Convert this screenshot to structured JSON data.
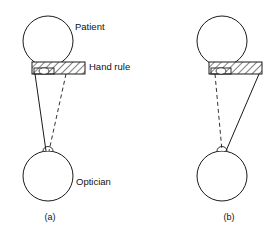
{
  "figure": {
    "width": 276,
    "height": 232,
    "background_color": "#ffffff",
    "line_color": "#1a1a1a",
    "text_color": "#111111",
    "labels": {
      "patient": "Patient",
      "hand_rule": "Hand rule",
      "optician": "Optician"
    },
    "panels": [
      {
        "caption": "(a)",
        "caption_x": 50,
        "caption_y": 218,
        "patient": {
          "cx": 48,
          "cy": 41,
          "r": 25
        },
        "optician": {
          "cx": 48,
          "cy": 176,
          "r": 25
        },
        "nose": {
          "cx": 48,
          "cy": 151,
          "rx": 5,
          "ry": 4.5
        },
        "bar": {
          "x": 32,
          "y": 62,
          "width": 53,
          "height": 12
        },
        "inner_box": {
          "x": 34,
          "y": 68,
          "width": 20,
          "height": 6
        },
        "tiny_ellipse": {
          "cx": 44,
          "cy": 71,
          "rx": 5,
          "ry": 3.2
        },
        "solid_line": {
          "x1": 35,
          "y1": 74,
          "x2": 46,
          "y2": 151
        },
        "dashed_line": {
          "x1": 66,
          "y1": 74,
          "x2": 49,
          "y2": 151
        },
        "patient_label_x": 75,
        "patient_label_y": 27,
        "hand_rule_label_x": 89,
        "hand_rule_label_y": 67,
        "optician_label_x": 76,
        "optician_label_y": 182,
        "show_patient_label": true,
        "show_hand_rule_label": true,
        "show_optician_label": true
      },
      {
        "caption": "(b)",
        "caption_x": 229,
        "caption_y": 218,
        "patient": {
          "cx": 222,
          "cy": 41,
          "r": 25
        },
        "optician": {
          "cx": 222,
          "cy": 176,
          "r": 25
        },
        "nose": {
          "cx": 222,
          "cy": 151,
          "rx": 5,
          "ry": 4.5
        },
        "bar": {
          "x": 209,
          "y": 62,
          "width": 53,
          "height": 12
        },
        "inner_box": {
          "x": 211,
          "y": 68,
          "width": 20,
          "height": 6
        },
        "tiny_ellipse": {
          "cx": 221,
          "cy": 71,
          "rx": 5,
          "ry": 3.2
        },
        "solid_line": {
          "x1": 259,
          "y1": 74,
          "x2": 226,
          "y2": 151
        },
        "dashed_line": {
          "x1": 215,
          "y1": 74,
          "x2": 222,
          "y2": 151
        },
        "patient_label_x": 0,
        "patient_label_y": 0,
        "hand_rule_label_x": 0,
        "hand_rule_label_y": 0,
        "optician_label_x": 0,
        "optician_label_y": 0,
        "show_patient_label": false,
        "show_hand_rule_label": false,
        "show_optician_label": false
      }
    ]
  }
}
